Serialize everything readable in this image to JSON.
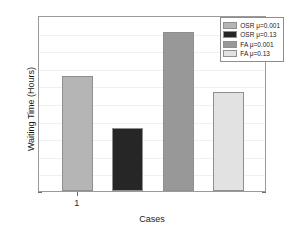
{
  "chart_data": {
    "type": "bar",
    "title": "",
    "xlabel": "Cases",
    "ylabel": "Waiting Time (Hours)",
    "categories": [
      "1"
    ],
    "xtick_labels": [
      "1"
    ],
    "ylim": [
      0,
      10
    ],
    "yticks": [
      0,
      1,
      2,
      3,
      4,
      5,
      6,
      7,
      8,
      9,
      10
    ],
    "ytick_labels": [
      "0",
      "1",
      "2",
      "3",
      "4",
      "5",
      "6",
      "7",
      "8",
      "9",
      "10"
    ],
    "grid": true,
    "legend_position": "top-right",
    "series": [
      {
        "name": "OSR μ=0.001",
        "values": [
          6.55
        ],
        "color": "#b5b5b5"
      },
      {
        "name": "OSR μ=0.13",
        "values": [
          3.6
        ],
        "color": "#262626"
      },
      {
        "name": "FA μ=0.001",
        "values": [
          9.05
        ],
        "color": "#989898"
      },
      {
        "name": "FA μ=0.13",
        "values": [
          5.65
        ],
        "color": "#e2e2e2"
      }
    ]
  },
  "legend": {
    "entries": [
      {
        "label": "OSR μ=0.001"
      },
      {
        "label": "OSR μ=0.13"
      },
      {
        "label": "FA μ=0.001"
      },
      {
        "label": "FA μ=0.13"
      }
    ]
  },
  "axes": {
    "edge_color": "#9a9a9a",
    "grid_color": "#f0f0f0",
    "text_color": "#1a1a1a"
  }
}
